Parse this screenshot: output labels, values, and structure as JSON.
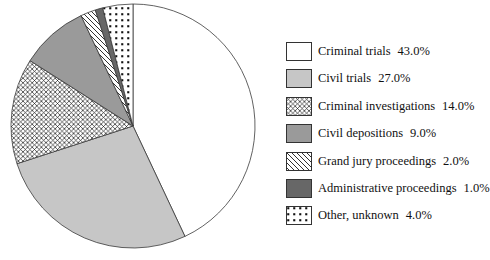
{
  "chart_data": {
    "type": "pie",
    "title": "",
    "categories": [
      "Criminal trials",
      "Civil trials",
      "Criminal investigations",
      "Civil depositions",
      "Grand jury proceedings",
      "Administrative proceedings",
      "Other, unknown"
    ],
    "values": [
      43.0,
      27.0,
      14.0,
      9.0,
      2.0,
      1.0,
      4.0
    ],
    "unit": "%",
    "start_angle": "12 o'clock",
    "direction": "clockwise",
    "legend_position": "right",
    "outline_color": "#3a3a3a",
    "pattern_line_color": "#1a1a1a",
    "slices": [
      {
        "label": "Criminal trials",
        "value": 43.0,
        "display": "43.0%",
        "fill": "#ffffff",
        "pattern": "none"
      },
      {
        "label": "Civil trials",
        "value": 27.0,
        "display": "27.0%",
        "fill": "#c6c6c6",
        "pattern": "none"
      },
      {
        "label": "Criminal investigations",
        "value": 14.0,
        "display": "14.0%",
        "fill": "#ffffff",
        "pattern": "crosshatch"
      },
      {
        "label": "Civil depositions",
        "value": 9.0,
        "display": "9.0%",
        "fill": "#9a9a9a",
        "pattern": "none"
      },
      {
        "label": "Grand jury proceedings",
        "value": 2.0,
        "display": "2.0%",
        "fill": "#ffffff",
        "pattern": "diagonal-lines"
      },
      {
        "label": "Administrative proceedings",
        "value": 1.0,
        "display": "1.0%",
        "fill": "#676767",
        "pattern": "none"
      },
      {
        "label": "Other, unknown",
        "value": 4.0,
        "display": "4.0%",
        "fill": "#ffffff",
        "pattern": "dots"
      }
    ],
    "pie_geometry": {
      "cx": 133,
      "cy": 126,
      "r": 122
    }
  }
}
